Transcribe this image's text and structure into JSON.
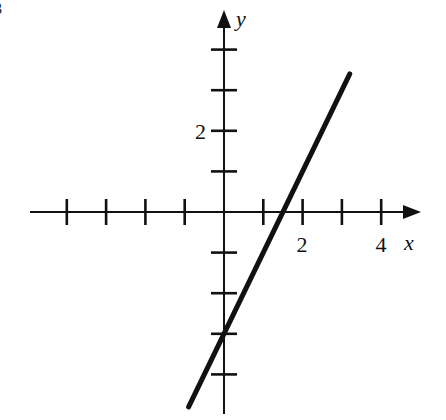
{
  "figure": {
    "corner_label": "3",
    "x_axis_label": "x",
    "y_axis_label": "y",
    "x_tick_labels": [
      {
        "value": 2,
        "text": "2"
      },
      {
        "value": 4,
        "text": "4"
      }
    ],
    "y_tick_labels": [
      {
        "value": 2,
        "text": "2"
      }
    ],
    "colors": {
      "ink": "#111111",
      "background": "#ffffff"
    }
  },
  "chart_data": {
    "type": "line",
    "title": "",
    "xlabel": "x",
    "ylabel": "y",
    "equation": "y = 2x - 3",
    "x_ticks": [
      -4,
      -3,
      -2,
      -1,
      1,
      2,
      3,
      4
    ],
    "y_ticks": [
      -4,
      -3,
      -2,
      -1,
      1,
      2,
      3,
      4
    ],
    "labeled_x_ticks": [
      2,
      4
    ],
    "labeled_y_ticks": [
      2
    ],
    "xlim": [
      -5,
      5
    ],
    "ylim": [
      -5,
      4.5
    ],
    "series": [
      {
        "name": "line",
        "x": [
          -0.9,
          3.2
        ],
        "y": [
          -4.8,
          3.4
        ]
      }
    ],
    "intercepts": {
      "x_intercept": 1.5,
      "y_intercept": -3
    },
    "grid": false,
    "legend": null
  }
}
